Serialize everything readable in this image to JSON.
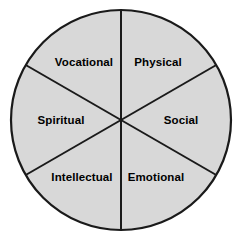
{
  "figure": {
    "background_color": "#ffffff"
  },
  "wheel": {
    "fill_color": "#d8d8d8",
    "outline_color": "#1a1a1a",
    "divider_color": "#1a1a1a",
    "label_color": "#000000",
    "center_x": 121,
    "center_y": 120,
    "radius": 110,
    "outline_width": 2.2,
    "divider_width": 2.0,
    "sector_count": 6
  },
  "chart_data": {
    "type": "pie",
    "categories": [
      "Physical",
      "Social",
      "Emotional",
      "Intellectual",
      "Spiritual",
      "Vocational"
    ],
    "values": [
      1,
      1,
      1,
      1,
      1,
      1
    ],
    "percentages": [
      16.67,
      16.67,
      16.67,
      16.67,
      16.67,
      16.67
    ],
    "slice_angle_degrees": 60,
    "equal_slices": true,
    "start_angle_degrees": -90,
    "direction": "clockwise",
    "colors": [
      "#d8d8d8",
      "#d8d8d8",
      "#d8d8d8",
      "#d8d8d8",
      "#d8d8d8",
      "#d8d8d8"
    ],
    "labels_inside": true,
    "legend": "none",
    "grid": false,
    "xlabel": "",
    "ylabel": ""
  },
  "sectors": [
    {
      "id": "physical",
      "label": "Physical",
      "position": "top-right",
      "label_x": 158,
      "label_y": 63,
      "anchor": "label-mid",
      "start_angle": -90,
      "end_angle": -30
    },
    {
      "id": "social",
      "label": "Social",
      "position": "right",
      "label_x": 181,
      "label_y": 121,
      "anchor": "label-mid",
      "start_angle": -30,
      "end_angle": 30
    },
    {
      "id": "emotional",
      "label": "Emotional",
      "position": "bottom-right",
      "label_x": 156,
      "label_y": 178,
      "anchor": "label-mid",
      "start_angle": 30,
      "end_angle": 90
    },
    {
      "id": "intellectual",
      "label": "Intellectual",
      "position": "bottom-left",
      "label_x": 82,
      "label_y": 178,
      "anchor": "label-mid",
      "start_angle": 90,
      "end_angle": 150
    },
    {
      "id": "spiritual",
      "label": "Spiritual",
      "position": "left",
      "label_x": 61,
      "label_y": 121,
      "anchor": "label-mid",
      "start_angle": 150,
      "end_angle": 210
    },
    {
      "id": "vocational",
      "label": "Vocational",
      "position": "top-left",
      "label_x": 84,
      "label_y": 63,
      "anchor": "label-mid",
      "start_angle": 210,
      "end_angle": 270
    }
  ],
  "dividers": [
    {
      "id": "vertical",
      "x1": 121,
      "y1": 10,
      "x2": 121,
      "y2": 230
    },
    {
      "id": "diagonal-nw-se",
      "x1": 25.7,
      "y1": 65,
      "x2": 216.3,
      "y2": 175
    },
    {
      "id": "diagonal-sw-ne",
      "x1": 25.7,
      "y1": 175,
      "x2": 216.3,
      "y2": 65
    }
  ]
}
